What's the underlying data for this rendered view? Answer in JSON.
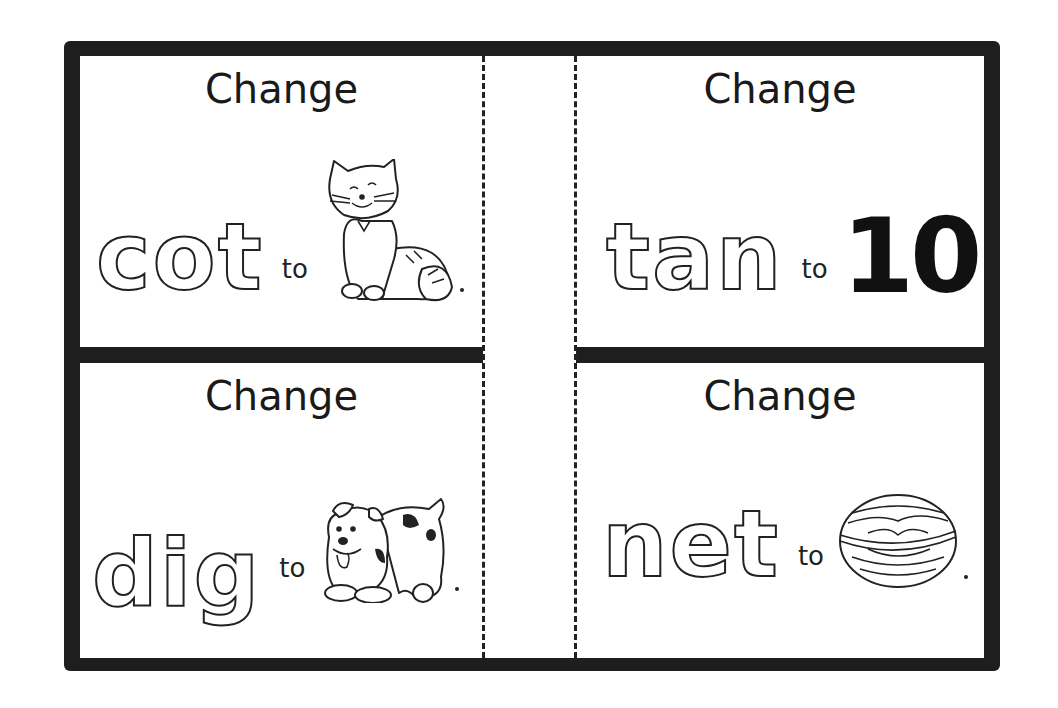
{
  "worksheet": {
    "cards": [
      {
        "position": "top-left",
        "prompt": "Change",
        "word": "cot",
        "connector": "to",
        "target_picture": "cat-picture",
        "period": "."
      },
      {
        "position": "top-right",
        "prompt": "Change",
        "word": "tan",
        "connector": "to",
        "target_number": "10",
        "period": "."
      },
      {
        "position": "bottom-left",
        "prompt": "Change",
        "word": "dig",
        "connector": "to",
        "target_picture": "dog-picture",
        "period": "."
      },
      {
        "position": "bottom-right",
        "prompt": "Change",
        "word": "net",
        "connector": "to",
        "target_picture": "nut-picture",
        "period": "."
      }
    ],
    "colors": {
      "border": "#1e1e1e",
      "background": "#ffffff",
      "ink": "#222222"
    }
  }
}
